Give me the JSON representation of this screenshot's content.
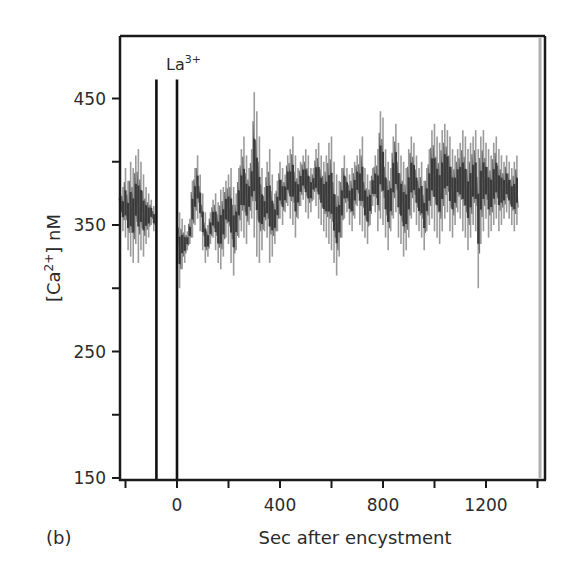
{
  "panel_label": "(b)",
  "chart_data": {
    "type": "line",
    "title": "",
    "panel": "(b)",
    "xlabel": "Sec after encystment",
    "ylabel": "[Ca2+] nM",
    "ylabel_parts": {
      "prefix": "[Ca",
      "sup": "2+",
      "suffix": "] nM"
    },
    "xlim": [
      -220,
      1425
    ],
    "ylim": [
      150,
      500
    ],
    "x_ticks": [
      -200,
      0,
      200,
      400,
      600,
      800,
      1000,
      1200,
      1400
    ],
    "x_tick_labels": [
      {
        "value": 0,
        "label": "0"
      },
      {
        "value": 400,
        "label": "400"
      },
      {
        "value": 800,
        "label": "800"
      },
      {
        "value": 1200,
        "label": "1200"
      }
    ],
    "y_ticks": [
      150,
      200,
      250,
      300,
      350,
      400,
      450
    ],
    "y_tick_labels": [
      {
        "value": 150,
        "label": "150"
      },
      {
        "value": 250,
        "label": "250"
      },
      {
        "value": 350,
        "label": "350"
      },
      {
        "value": 450,
        "label": "450"
      }
    ],
    "grid": false,
    "legend": null,
    "annotations": [
      {
        "text": "La",
        "sup": "3+",
        "x": 0,
        "y": 478
      }
    ],
    "markers": [
      {
        "type": "vertical-line",
        "x": -80,
        "y_top": 465
      },
      {
        "type": "vertical-line",
        "x": 0,
        "y_top": 465
      }
    ],
    "series": [
      {
        "name": "[Ca2+] trace",
        "x_step": 10,
        "x_start": -220,
        "y_range_per_sample": [
          [
            355,
            375
          ],
          [
            345,
            380
          ],
          [
            340,
            395
          ],
          [
            330,
            385
          ],
          [
            325,
            400
          ],
          [
            320,
            395
          ],
          [
            335,
            405
          ],
          [
            320,
            410
          ],
          [
            330,
            400
          ],
          [
            325,
            390
          ],
          [
            335,
            380
          ],
          [
            340,
            375
          ],
          [
            350,
            370
          ],
          [
            345,
            365
          ],
          [
            350,
            372
          ],
          [
            352,
            368
          ],
          [
            355,
            370
          ],
          [
            350,
            375
          ],
          [
            355,
            370
          ],
          [
            350,
            368
          ],
          [
            330,
            372
          ],
          [
            310,
            368
          ],
          [
            295,
            365
          ],
          [
            300,
            360
          ],
          [
            315,
            355
          ],
          [
            320,
            350
          ],
          [
            330,
            345
          ],
          [
            335,
            355
          ],
          [
            340,
            385
          ],
          [
            350,
            395
          ],
          [
            355,
            405
          ],
          [
            345,
            390
          ],
          [
            330,
            375
          ],
          [
            320,
            360
          ],
          [
            325,
            350
          ],
          [
            335,
            360
          ],
          [
            340,
            370
          ],
          [
            330,
            375
          ],
          [
            320,
            368
          ],
          [
            315,
            378
          ],
          [
            325,
            380
          ],
          [
            340,
            385
          ],
          [
            335,
            390
          ],
          [
            320,
            395
          ],
          [
            310,
            380
          ],
          [
            330,
            375
          ],
          [
            340,
            395
          ],
          [
            345,
            410
          ],
          [
            340,
            420
          ],
          [
            335,
            405
          ],
          [
            350,
            395
          ],
          [
            355,
            410
          ],
          [
            340,
            455
          ],
          [
            325,
            440
          ],
          [
            320,
            420
          ],
          [
            330,
            395
          ],
          [
            345,
            380
          ],
          [
            340,
            400
          ],
          [
            320,
            410
          ],
          [
            325,
            390
          ],
          [
            335,
            375
          ],
          [
            345,
            385
          ],
          [
            355,
            400
          ],
          [
            350,
            395
          ],
          [
            360,
            390
          ],
          [
            365,
            405
          ],
          [
            355,
            410
          ],
          [
            350,
            420
          ],
          [
            340,
            405
          ],
          [
            355,
            395
          ],
          [
            365,
            400
          ],
          [
            370,
            405
          ],
          [
            360,
            410
          ],
          [
            355,
            405
          ],
          [
            360,
            395
          ],
          [
            370,
            395
          ],
          [
            365,
            410
          ],
          [
            355,
            415
          ],
          [
            350,
            405
          ],
          [
            345,
            400
          ],
          [
            340,
            405
          ],
          [
            335,
            415
          ],
          [
            330,
            420
          ],
          [
            320,
            400
          ],
          [
            310,
            390
          ],
          [
            325,
            385
          ],
          [
            340,
            395
          ],
          [
            355,
            405
          ],
          [
            360,
            395
          ],
          [
            350,
            390
          ],
          [
            345,
            395
          ],
          [
            355,
            400
          ],
          [
            365,
            405
          ],
          [
            350,
            410
          ],
          [
            345,
            420
          ],
          [
            340,
            395
          ],
          [
            335,
            390
          ],
          [
            350,
            385
          ],
          [
            365,
            395
          ],
          [
            360,
            405
          ],
          [
            345,
            410
          ],
          [
            355,
            440
          ],
          [
            350,
            435
          ],
          [
            340,
            410
          ],
          [
            330,
            400
          ],
          [
            345,
            395
          ],
          [
            355,
            420
          ],
          [
            360,
            430
          ],
          [
            340,
            415
          ],
          [
            335,
            405
          ],
          [
            325,
            400
          ],
          [
            330,
            395
          ],
          [
            340,
            410
          ],
          [
            355,
            420
          ],
          [
            360,
            415
          ],
          [
            350,
            405
          ],
          [
            345,
            395
          ],
          [
            340,
            400
          ],
          [
            330,
            385
          ],
          [
            345,
            395
          ],
          [
            350,
            410
          ],
          [
            355,
            425
          ],
          [
            345,
            430
          ],
          [
            340,
            420
          ],
          [
            335,
            415
          ],
          [
            345,
            425
          ],
          [
            355,
            430
          ],
          [
            360,
            425
          ],
          [
            345,
            420
          ],
          [
            340,
            410
          ],
          [
            350,
            405
          ],
          [
            360,
            410
          ],
          [
            355,
            415
          ],
          [
            345,
            425
          ],
          [
            340,
            420
          ],
          [
            330,
            410
          ],
          [
            340,
            415
          ],
          [
            350,
            420
          ],
          [
            345,
            425
          ],
          [
            300,
            410
          ],
          [
            335,
            420
          ],
          [
            345,
            425
          ],
          [
            355,
            415
          ],
          [
            340,
            410
          ],
          [
            345,
            405
          ],
          [
            350,
            415
          ],
          [
            355,
            420
          ],
          [
            345,
            410
          ],
          [
            350,
            405
          ],
          [
            355,
            400
          ],
          [
            360,
            405
          ],
          [
            355,
            400
          ],
          [
            350,
            395
          ],
          [
            345,
            400
          ],
          [
            350,
            405
          ]
        ]
      }
    ]
  },
  "colors": {
    "axis": "#1a1a1a",
    "trace": "#3a3a3a",
    "trace_light": "#8a8a8a",
    "marker": "#111111",
    "text": "#2b2b2b",
    "right_band": "#b0b0b0"
  }
}
